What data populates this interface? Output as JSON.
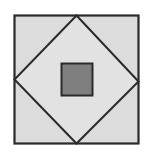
{
  "diagram": {
    "colors": {
      "background": "#ffffff",
      "fill_light": "#dcdcdc",
      "center_fill": "#7f7f7f",
      "stroke": "#2a2a2a"
    },
    "shapes": {
      "outer_square": {
        "x": 14.5,
        "y": 15.5,
        "width": 124,
        "height": 128
      },
      "diamond": {
        "top": [
          76.5,
          15.5
        ],
        "right": [
          138.5,
          81.5
        ],
        "bottom": [
          76.5,
          143.5
        ],
        "left": [
          14.5,
          79.5
        ]
      },
      "center_square": {
        "x": 61.5,
        "y": 63.5,
        "width": 31,
        "height": 32
      }
    }
  }
}
